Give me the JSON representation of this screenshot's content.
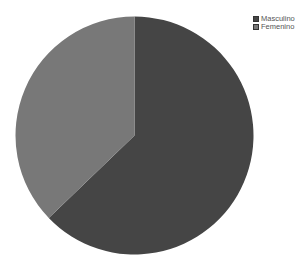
{
  "chart_data": {
    "type": "pie",
    "title": "",
    "categories": [
      "Masculino",
      "Femenino"
    ],
    "values": [
      62.8,
      37.2
    ],
    "colors": [
      "#454545",
      "#787878"
    ],
    "start_angle_deg": 0,
    "direction": "clockwise",
    "legend_position": "top-right",
    "legend": [
      {
        "label": "Masculino",
        "color": "#454545"
      },
      {
        "label": "Femenino",
        "color": "#787878"
      }
    ]
  },
  "layout": {
    "cx": 134.5,
    "cy": 135.5,
    "r": 119
  }
}
